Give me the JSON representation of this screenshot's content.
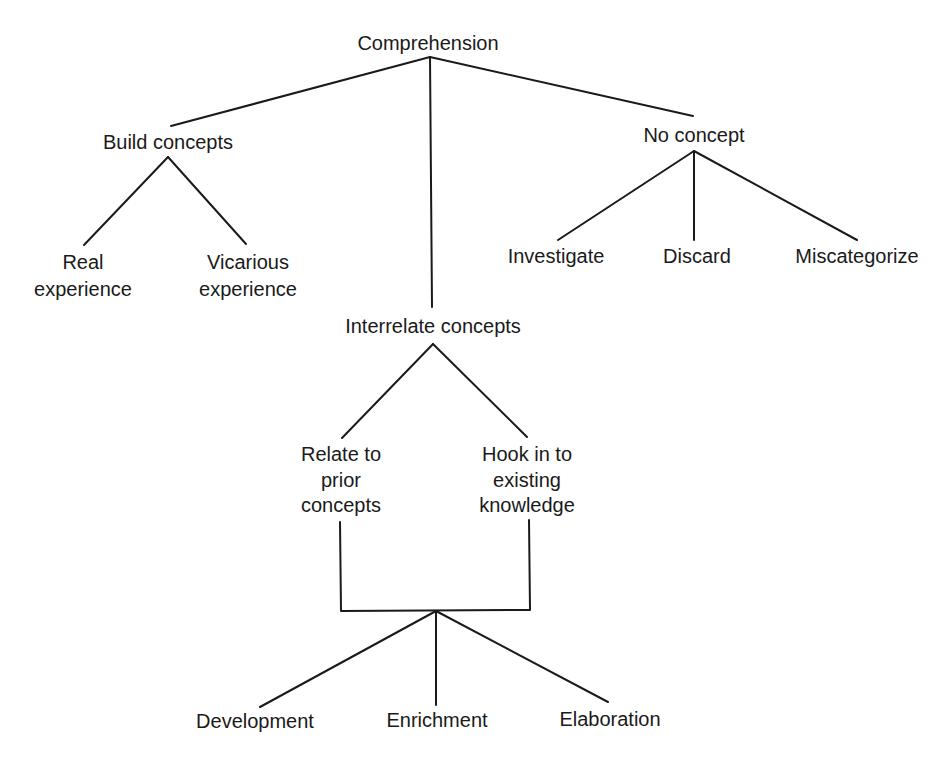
{
  "diagram": {
    "type": "tree",
    "nodes": {
      "root": {
        "label": "Comprehension",
        "lines": [
          "Comprehension"
        ]
      },
      "build": {
        "label": "Build concepts",
        "lines": [
          "Build concepts"
        ]
      },
      "real": {
        "label": "Real experience",
        "lines": [
          "Real",
          "experience"
        ]
      },
      "vicarious": {
        "label": "Vicarious experience",
        "lines": [
          "Vicarious",
          "experience"
        ]
      },
      "interrelate": {
        "label": "Interrelate concepts",
        "lines": [
          "Interrelate concepts"
        ]
      },
      "relate": {
        "label": "Relate to prior concepts",
        "lines": [
          "Relate to",
          "prior",
          "concepts"
        ]
      },
      "hook": {
        "label": "Hook in to existing knowledge",
        "lines": [
          "Hook in to",
          "existing",
          "knowledge"
        ]
      },
      "development": {
        "label": "Development",
        "lines": [
          "Development"
        ]
      },
      "enrichment": {
        "label": "Enrichment",
        "lines": [
          "Enrichment"
        ]
      },
      "elaboration": {
        "label": "Elaboration",
        "lines": [
          "Elaboration"
        ]
      },
      "noconcept": {
        "label": "No concept",
        "lines": [
          "No concept"
        ]
      },
      "investigate": {
        "label": "Investigate",
        "lines": [
          "Investigate"
        ]
      },
      "discard": {
        "label": "Discard",
        "lines": [
          "Discard"
        ]
      },
      "miscategorize": {
        "label": "Miscategorize",
        "lines": [
          "Miscategorize"
        ]
      }
    },
    "edges": [
      [
        "root",
        "build"
      ],
      [
        "root",
        "interrelate"
      ],
      [
        "root",
        "noconcept"
      ],
      [
        "build",
        "real"
      ],
      [
        "build",
        "vicarious"
      ],
      [
        "noconcept",
        "investigate"
      ],
      [
        "noconcept",
        "discard"
      ],
      [
        "noconcept",
        "miscategorize"
      ],
      [
        "interrelate",
        "relate"
      ],
      [
        "interrelate",
        "hook"
      ],
      [
        "relate+hook",
        "development"
      ],
      [
        "relate+hook",
        "enrichment"
      ],
      [
        "relate+hook",
        "elaboration"
      ]
    ]
  }
}
